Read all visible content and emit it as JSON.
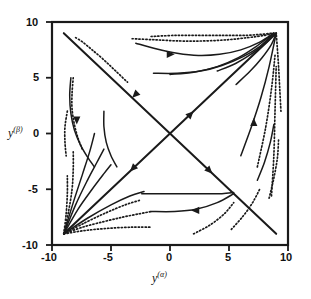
{
  "figure": {
    "kind": "phase-portrait",
    "background_color": "#ffffff",
    "stroke_color": "#1a1a1a"
  },
  "axes": {
    "x_title": "y",
    "x_title_sup": "(α)",
    "y_title": "y",
    "y_title_sup": "(β)",
    "x_ticks": [
      "-10",
      "-5",
      "0",
      "5",
      "10"
    ],
    "y_ticks": [
      "10",
      "5",
      "0",
      "-5",
      "-10"
    ]
  },
  "chart_data": {
    "type": "line",
    "title": "",
    "xlabel": "y^(alpha)",
    "ylabel": "y^(beta)",
    "xlim": [
      -10,
      10
    ],
    "ylim": [
      -10,
      10
    ],
    "xticks": [
      -10,
      -5,
      0,
      5,
      10
    ],
    "yticks": [
      -10,
      -5,
      0,
      5,
      10
    ],
    "grid": false,
    "legend": "none",
    "annotations": [
      {
        "text": "saddle point",
        "x": 0,
        "y": 0
      },
      {
        "text": "stable node",
        "x": 9,
        "y": 9
      },
      {
        "text": "stable node",
        "x": -9,
        "y": -9
      }
    ],
    "series": [
      {
        "name": "separatrix-main-diagonal",
        "style": "solid",
        "x": [
          -9,
          9
        ],
        "y": [
          -9,
          9
        ],
        "arrows": [
          {
            "x": -3.4,
            "y": -3.4,
            "dir": "down-left"
          },
          {
            "x": 2.0,
            "y": 2.0,
            "dir": "up-right"
          }
        ]
      },
      {
        "name": "separatrix-anti-diagonal",
        "style": "solid",
        "x": [
          -9,
          9
        ],
        "y": [
          9,
          -9
        ],
        "arrows": [
          {
            "x": -3.2,
            "y": 3.2,
            "dir": "down-left"
          },
          {
            "x": 3.6,
            "y": -3.6,
            "dir": "down-right"
          }
        ]
      },
      {
        "name": "traj-ul-dotted-1",
        "style": "dotted",
        "x": [
          -8.0,
          -7.4,
          -6.6,
          -5.6,
          -4.6,
          -3.6
        ],
        "y": [
          8.6,
          8.2,
          7.5,
          6.6,
          5.6,
          4.6
        ]
      },
      {
        "name": "traj-ul-dotted-2",
        "style": "dotted",
        "x": [
          -8.2,
          -8.3,
          -8.3,
          -8.1,
          -7.8,
          -7.4
        ],
        "y": [
          5.0,
          3.6,
          2.2,
          0.8,
          -0.4,
          -1.5
        ]
      },
      {
        "name": "traj-ul-solid-1",
        "style": "solid",
        "x": [
          -8.4,
          -8.5,
          -8.4,
          -8.1,
          -7.6,
          -7.0,
          -6.4
        ],
        "y": [
          5.0,
          3.4,
          1.8,
          0.3,
          -1.0,
          -2.1,
          -3.0
        ],
        "arrows": [
          {
            "x": -7.9,
            "y": 0.8,
            "dir": "down"
          }
        ]
      },
      {
        "name": "traj-ul-solid-2",
        "style": "solid",
        "x": [
          -5.6,
          -5.6,
          -5.4,
          -5.0,
          -4.5
        ],
        "y": [
          2.0,
          0.6,
          -0.8,
          -2.0,
          -3.0
        ]
      },
      {
        "name": "traj-ul-dotted-3",
        "style": "dotted",
        "x": [
          -8.7,
          -8.9,
          -8.9,
          -8.8
        ],
        "y": [
          2.0,
          0.6,
          -0.8,
          -2.0
        ]
      },
      {
        "name": "traj-ur-dotted-1",
        "style": "dotted",
        "x": [
          -1.6,
          0.5,
          2.6,
          4.6,
          6.4,
          7.8,
          8.7
        ],
        "y": [
          8.7,
          8.8,
          8.8,
          8.8,
          8.8,
          8.9,
          9.0
        ]
      },
      {
        "name": "traj-ur-dotted-2",
        "style": "dotted",
        "x": [
          -3.2,
          -1.2,
          0.8,
          2.8,
          4.8,
          6.6,
          8.0,
          8.8
        ],
        "y": [
          8.5,
          8.4,
          8.3,
          8.3,
          8.4,
          8.6,
          8.8,
          9.0
        ]
      },
      {
        "name": "traj-ur-solid-1",
        "style": "solid",
        "x": [
          -2.9,
          -1.2,
          0.6,
          2.4,
          4.2,
          6.0,
          7.6,
          8.8
        ],
        "y": [
          8.1,
          7.6,
          7.2,
          7.0,
          7.1,
          7.5,
          8.2,
          9.0
        ],
        "arrows": [
          {
            "x": 0.4,
            "y": 7.1,
            "dir": "right"
          }
        ]
      },
      {
        "name": "traj-ur-solid-2",
        "style": "solid",
        "x": [
          -1.4,
          0.6,
          2.6,
          4.4,
          6.2,
          7.6,
          8.8
        ],
        "y": [
          5.4,
          5.4,
          5.6,
          6.1,
          6.9,
          7.8,
          9.0
        ]
      },
      {
        "name": "traj-ur-solid-3",
        "style": "solid",
        "x": [
          0.0,
          2.0,
          4.0,
          5.8,
          7.3,
          8.8
        ],
        "y": [
          5.3,
          5.5,
          6.0,
          6.8,
          7.8,
          9.0
        ]
      },
      {
        "name": "traj-ur-solid-4",
        "style": "solid",
        "x": [
          4.0,
          5.6,
          7.0,
          8.2,
          8.9
        ],
        "y": [
          5.6,
          6.3,
          7.2,
          8.2,
          9.0
        ]
      },
      {
        "name": "traj-ur-solid-5",
        "style": "solid",
        "x": [
          5.6,
          6.8,
          7.8,
          8.6,
          9.0
        ],
        "y": [
          4.4,
          5.6,
          6.8,
          8.0,
          9.0
        ]
      },
      {
        "name": "traj-ur-solid-6",
        "style": "solid",
        "x": [
          6.0,
          6.9,
          7.7,
          8.4,
          9.0
        ],
        "y": [
          -2.0,
          0.6,
          3.2,
          6.0,
          9.0
        ],
        "arrows": [
          {
            "x": 7.1,
            "y": 1.4,
            "dir": "up"
          }
        ]
      },
      {
        "name": "traj-ur-dotted-3",
        "style": "dotted",
        "x": [
          9.4,
          9.3,
          9.2,
          9.1,
          9.0
        ],
        "y": [
          2.0,
          4.0,
          6.0,
          7.6,
          9.0
        ]
      },
      {
        "name": "traj-ur-dotted-4",
        "style": "dotted",
        "x": [
          8.6,
          8.8,
          8.9,
          9.0
        ],
        "y": [
          -5.6,
          -2.0,
          2.0,
          6.0
        ]
      },
      {
        "name": "traj-ur-dotted-5",
        "style": "dotted",
        "x": [
          7.4,
          8.1,
          8.6,
          8.9
        ],
        "y": [
          -3.0,
          0.5,
          4.0,
          7.0
        ]
      },
      {
        "name": "traj-ll-solid-1",
        "style": "solid",
        "x": [
          -9.0,
          -8.2,
          -7.4,
          -6.8,
          -6.4
        ],
        "y": [
          -9.0,
          -6.2,
          -3.6,
          -1.6,
          0.0
        ]
      },
      {
        "name": "traj-ll-solid-2",
        "style": "solid",
        "x": [
          -9.0,
          -8.0,
          -7.0,
          -6.2,
          -5.6
        ],
        "y": [
          -9.0,
          -6.4,
          -4.2,
          -2.6,
          -1.4
        ]
      },
      {
        "name": "traj-ll-solid-3",
        "style": "solid",
        "x": [
          -9.0,
          -7.8,
          -6.6,
          -5.6,
          -5.0
        ],
        "y": [
          -9.0,
          -6.8,
          -5.0,
          -3.6,
          -2.8
        ]
      },
      {
        "name": "traj-ll-dotted-1",
        "style": "dotted",
        "x": [
          -9.0,
          -8.6,
          -8.3,
          -8.2,
          -8.2
        ],
        "y": [
          -9.0,
          -7.0,
          -5.0,
          -3.2,
          -1.6
        ]
      },
      {
        "name": "traj-ll-dotted-2",
        "style": "dotted",
        "x": [
          -9.0,
          -8.8,
          -8.7,
          -8.7
        ],
        "y": [
          -9.0,
          -7.2,
          -5.4,
          -3.8
        ]
      },
      {
        "name": "traj-ll-solid-4",
        "style": "solid",
        "x": [
          -9.0,
          -7.0,
          -5.0,
          -3.4,
          -2.2
        ],
        "y": [
          -9.0,
          -7.6,
          -6.4,
          -5.6,
          -5.2
        ]
      },
      {
        "name": "traj-ll-dotted-3",
        "style": "dotted",
        "x": [
          -9.0,
          -7.2,
          -5.4,
          -3.8,
          -2.6
        ],
        "y": [
          -9.0,
          -8.0,
          -7.1,
          -6.4,
          -6.0
        ]
      },
      {
        "name": "traj-ll-dotted-4",
        "style": "dotted",
        "x": [
          -9.0,
          -7.4,
          -5.6,
          -4.0,
          -2.6,
          -1.6
        ],
        "y": [
          -9.0,
          -8.4,
          -7.9,
          -7.5,
          -7.2,
          -7.0
        ]
      },
      {
        "name": "traj-ll-dotted-5",
        "style": "dotted",
        "x": [
          -9.0,
          -7.2,
          -5.2,
          -3.2,
          -1.6
        ],
        "y": [
          -9.0,
          -8.7,
          -8.5,
          -8.4,
          -8.4
        ]
      },
      {
        "name": "traj-lr-solid-1",
        "style": "solid",
        "x": [
          -1.6,
          0.4,
          2.2,
          4.0,
          5.4
        ],
        "y": [
          -7.0,
          -7.0,
          -6.8,
          -6.2,
          -5.4
        ],
        "arrows": [
          {
            "x": 1.8,
            "y": -6.9,
            "dir": "left"
          }
        ]
      },
      {
        "name": "traj-lr-solid-2",
        "style": "solid",
        "x": [
          -2.4,
          -0.6,
          1.2,
          3.0,
          4.4,
          5.4
        ],
        "y": [
          -5.4,
          -5.4,
          -5.4,
          -5.4,
          -5.4,
          -5.3
        ]
      },
      {
        "name": "traj-lr-dotted-1",
        "style": "dotted",
        "x": [
          2.0,
          3.4,
          4.6,
          5.4
        ],
        "y": [
          -9.0,
          -8.2,
          -7.2,
          -6.2
        ]
      },
      {
        "name": "traj-lr-dotted-2",
        "style": "dotted",
        "x": [
          5.2,
          6.2,
          7.0,
          7.6
        ],
        "y": [
          -8.6,
          -7.4,
          -6.2,
          -5.0
        ]
      },
      {
        "name": "traj-lr-solid-3",
        "style": "solid",
        "x": [
          7.4,
          8.0,
          8.5,
          8.8
        ],
        "y": [
          -4.2,
          -2.6,
          -0.8,
          0.8
        ]
      },
      {
        "name": "traj-lr-dotted-3",
        "style": "dotted",
        "x": [
          8.4,
          8.8,
          9.1,
          9.2
        ],
        "y": [
          -5.8,
          -4.0,
          -2.2,
          -0.6
        ]
      }
    ]
  }
}
